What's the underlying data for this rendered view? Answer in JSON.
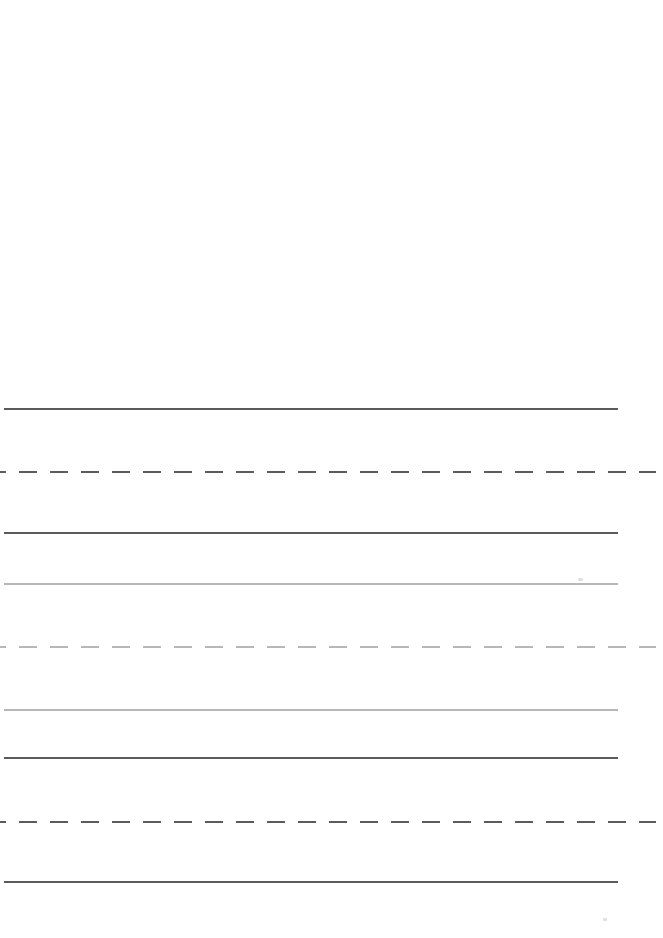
{
  "figure": {
    "title": "",
    "background_color": "#ffffff",
    "width": 663,
    "height": 938
  },
  "chart_data": {
    "type": "line",
    "title": "",
    "xlabel": "",
    "ylabel": "",
    "grid": false,
    "legend": "none",
    "xlim": [
      0,
      663
    ],
    "ylim": [
      938,
      0
    ],
    "axis_visible": false,
    "tick_labels_x": [],
    "tick_labels_y": [],
    "series": [
      {
        "name": "line-1",
        "linestyle": "solid",
        "color": "#5b5b5b",
        "linewidth": 2.4,
        "y": 409,
        "x_start": 4,
        "x_end": 618,
        "dash_length": 0,
        "gap_length": 0,
        "values": [
          409,
          409
        ]
      },
      {
        "name": "line-2",
        "linestyle": "dashed",
        "color": "#5b5b5b",
        "linewidth": 2.6,
        "y": 472,
        "x_start": 0,
        "x_end": 656,
        "dash_length": 18,
        "gap_length": 13,
        "values": [
          472,
          472
        ]
      },
      {
        "name": "line-3",
        "linestyle": "solid",
        "color": "#5b5b5b",
        "linewidth": 2.6,
        "y": 533,
        "x_start": 4,
        "x_end": 618,
        "dash_length": 0,
        "gap_length": 0,
        "values": [
          533,
          533
        ]
      },
      {
        "name": "line-4",
        "linestyle": "solid",
        "color": "#b7b7b7",
        "linewidth": 2.2,
        "y": 584,
        "x_start": 4,
        "x_end": 618,
        "dash_length": 0,
        "gap_length": 0,
        "values": [
          584,
          584
        ]
      },
      {
        "name": "line-5",
        "linestyle": "dashed",
        "color": "#b7b7b7",
        "linewidth": 2.6,
        "y": 647,
        "x_start": 0,
        "x_end": 656,
        "dash_length": 18,
        "gap_length": 13,
        "values": [
          647,
          647
        ]
      },
      {
        "name": "line-6",
        "linestyle": "solid",
        "color": "#b7b7b7",
        "linewidth": 2.4,
        "y": 710,
        "x_start": 4,
        "x_end": 618,
        "dash_length": 0,
        "gap_length": 0,
        "values": [
          710,
          710
        ]
      },
      {
        "name": "line-7",
        "linestyle": "solid",
        "color": "#5b5b5b",
        "linewidth": 2.6,
        "y": 758,
        "x_start": 4,
        "x_end": 618,
        "dash_length": 0,
        "gap_length": 0,
        "values": [
          758,
          758
        ]
      },
      {
        "name": "line-8",
        "linestyle": "dashed",
        "color": "#5b5b5b",
        "linewidth": 2.6,
        "y": 822,
        "x_start": 0,
        "x_end": 656,
        "dash_length": 18,
        "gap_length": 13,
        "values": [
          822,
          822
        ]
      },
      {
        "name": "line-9",
        "linestyle": "solid",
        "color": "#5b5b5b",
        "linewidth": 2.6,
        "y": 882,
        "x_start": 4,
        "x_end": 618,
        "dash_length": 0,
        "gap_length": 0,
        "values": [
          882,
          882
        ]
      }
    ],
    "annotations": [],
    "artifacts": [
      {
        "name": "speck-upper-right",
        "x": 578,
        "y": 578,
        "width": 5,
        "height": 3
      },
      {
        "name": "speck-lower-right",
        "x": 603,
        "y": 918,
        "width": 4,
        "height": 3
      }
    ]
  }
}
